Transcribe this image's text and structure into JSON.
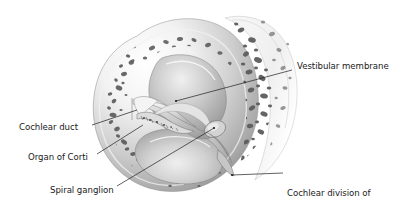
{
  "figure": {
    "background_color": "#ffffff",
    "ink_color": "#1a1a1a",
    "bone_color": "#9a9a9a",
    "bone_light": "#e8e8e8",
    "lumen_color": "#bdbdbd",
    "leader_line_color": "#1e1e1e",
    "leader_line_width": 0.7
  },
  "labels": [
    {
      "id": "vestibular-membrane",
      "text": "Vestibular membrane",
      "side": "right",
      "x": 297,
      "y": 61,
      "leader": {
        "x1": 292,
        "y1": 70,
        "x2": 176,
        "y2": 101
      }
    },
    {
      "id": "cochlear-duct",
      "text": "Cochlear duct",
      "side": "left",
      "x": 19,
      "y": 122,
      "leader": {
        "x1": 92,
        "y1": 125,
        "x2": 137,
        "y2": 110
      }
    },
    {
      "id": "organ-of-corti",
      "text": "Organ of Corti",
      "side": "left",
      "x": 28,
      "y": 152,
      "leader": {
        "x1": 97,
        "y1": 154,
        "x2": 143,
        "y2": 125
      }
    },
    {
      "id": "spiral-ganglion",
      "text": "Spiral ganglion",
      "side": "left",
      "x": 50,
      "y": 185,
      "leader": {
        "x1": 117,
        "y1": 186,
        "x2": 214,
        "y2": 128
      }
    },
    {
      "id": "cochlear-division-nerve",
      "text": "Cochlear division of\nvestibulocochlear nerve",
      "line1": "Cochlear division of",
      "line2": "vestibulocochlear nerve",
      "side": "right",
      "x": 287,
      "y": 168,
      "leader": {
        "x1": 283,
        "y1": 173,
        "x2": 232,
        "y2": 175
      }
    }
  ],
  "anatomy": {
    "structures": [
      "scala vestibuli",
      "scala tympani",
      "cochlear duct (scala media)",
      "vestibular membrane",
      "organ of Corti",
      "spiral ganglion",
      "modiolus",
      "trabecular (spongy) bone"
    ]
  }
}
